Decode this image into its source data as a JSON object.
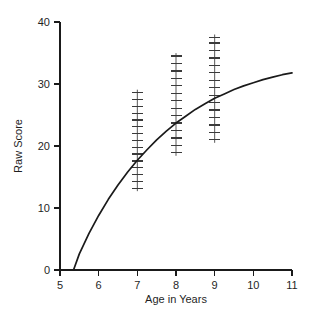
{
  "chart_data": {
    "type": "scatter",
    "title": "",
    "xlabel": "Age in Years",
    "ylabel": "Raw Score",
    "xlim": [
      5,
      11
    ],
    "ylim": [
      0,
      40
    ],
    "xticks": [
      5,
      6,
      7,
      8,
      9,
      10,
      11
    ],
    "xtick_labels": [
      "5",
      "6",
      "7",
      "8",
      "9",
      "10",
      "11"
    ],
    "yticks": [
      0,
      10,
      20,
      30,
      40
    ],
    "ytick_labels": [
      "0",
      "10",
      "20",
      "30",
      "40"
    ],
    "grid": false,
    "legend": null,
    "line_color": "#1a1a1a",
    "marker_color": "#3a3a3a",
    "axis_color": "#1a1a1a",
    "series": [
      {
        "name": "Fitted growth curve",
        "type": "line",
        "x": [
          5.35,
          5.5,
          5.75,
          6.0,
          6.25,
          6.5,
          6.75,
          7.0,
          7.25,
          7.5,
          7.75,
          8.0,
          8.25,
          8.5,
          8.75,
          9.0,
          9.25,
          9.5,
          9.75,
          10.0,
          10.25,
          10.5,
          10.75,
          11.0
        ],
        "y": [
          0.0,
          2.6,
          5.9,
          8.8,
          11.4,
          13.7,
          15.8,
          17.7,
          19.4,
          21.0,
          22.4,
          23.7,
          24.8,
          25.9,
          26.8,
          27.7,
          28.4,
          29.1,
          29.7,
          30.2,
          30.7,
          31.1,
          31.5,
          31.8
        ]
      },
      {
        "name": "Observed scores at age 7",
        "type": "marker-column",
        "x": 7,
        "values": [
          13.2,
          14.3,
          15.4,
          16.5,
          17.6,
          18.7,
          19.8,
          20.9,
          22.0,
          23.1,
          24.2,
          25.3,
          26.4,
          27.5,
          28.6
        ]
      },
      {
        "name": "Observed scores at age 8",
        "type": "marker-column",
        "x": 8,
        "values": [
          18.9,
          20.1,
          21.3,
          22.5,
          23.7,
          24.9,
          26.1,
          27.3,
          28.5,
          29.7,
          30.9,
          32.1,
          33.3,
          34.5
        ]
      },
      {
        "name": "Observed scores at age 9",
        "type": "marker-column",
        "x": 9,
        "values": [
          21.0,
          22.2,
          23.4,
          24.6,
          25.8,
          27.0,
          28.2,
          29.4,
          30.6,
          31.8,
          33.0,
          34.2,
          35.4,
          36.6,
          37.5
        ]
      }
    ]
  },
  "figure": {
    "background": "#ffffff"
  }
}
